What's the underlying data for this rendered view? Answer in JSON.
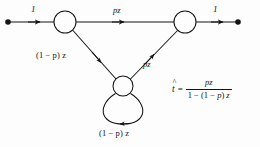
{
  "figure": {
    "type": "signal-flow-graph",
    "background_color": "#fdfdfd",
    "stroke_color": "#141414"
  },
  "nodes": [
    {
      "id": "source",
      "kind": "terminal-dot",
      "x": 8,
      "y": 22,
      "label": ""
    },
    {
      "id": "left",
      "kind": "circle",
      "x": 65,
      "y": 22,
      "r": 11,
      "label": ""
    },
    {
      "id": "right",
      "kind": "circle",
      "x": 185,
      "y": 22,
      "r": 11,
      "label": ""
    },
    {
      "id": "bottom",
      "kind": "circle",
      "x": 123,
      "y": 86,
      "r": 10,
      "label": ""
    },
    {
      "id": "sink",
      "kind": "terminal-dot",
      "x": 238,
      "y": 22,
      "label": ""
    }
  ],
  "edges": [
    {
      "id": "in",
      "from": "source",
      "to": "left",
      "label": "1",
      "label_x": 31,
      "label_y": 6
    },
    {
      "id": "top",
      "from": "left",
      "to": "right",
      "label": "pz",
      "label_x": 114,
      "label_y": 7
    },
    {
      "id": "left-diag",
      "from": "left",
      "to": "bottom",
      "label": "(1 − p) z",
      "label_x": 37,
      "label_y": 52
    },
    {
      "id": "right-diag",
      "from": "bottom",
      "to": "right",
      "label": "pz",
      "label_x": 143,
      "label_y": 61
    },
    {
      "id": "self-loop",
      "from": "bottom",
      "to": "bottom",
      "label": "(1 − p) z",
      "label_x": 100,
      "label_y": 129
    },
    {
      "id": "out",
      "from": "right",
      "to": "sink",
      "label": "1",
      "label_x": 214,
      "label_y": 6
    }
  ],
  "formula": {
    "lhs": "t",
    "lhs_accent": "^",
    "equals": "=",
    "numerator": "pz",
    "denominator_prefix": "1 − (1 − ",
    "denominator_var": "p",
    "denominator_suffix": ") ",
    "denominator_tail": "z",
    "full_text": "t̂ = pz / (1 − (1 − p) z)"
  }
}
